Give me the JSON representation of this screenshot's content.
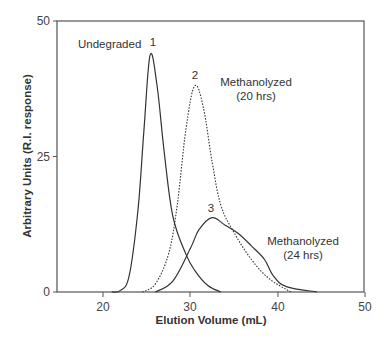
{
  "chart_data": {
    "type": "line",
    "title": "",
    "xlabel": "Elution Volume (mL)",
    "ylabel": "Arbitrary Units (R.I. response)",
    "xlim": [
      15,
      50
    ],
    "ylim": [
      0,
      50
    ],
    "xticks": [
      "20",
      "30",
      "40",
      "50"
    ],
    "yticks": [
      "0",
      "25",
      "50"
    ],
    "grid": false,
    "series": [
      {
        "name": "Undegraded",
        "peak_label": "1",
        "style": "solid",
        "x": [
          21,
          22,
          23,
          24,
          24.7,
          25.4,
          26.2,
          27,
          28,
          29.5,
          30.5,
          32,
          33.5
        ],
        "y": [
          0,
          0.3,
          3,
          15,
          30,
          43.7,
          38,
          26,
          14,
          7,
          4,
          1.2,
          0
        ]
      },
      {
        "name": "Methanolyzed (20 hrs)",
        "peak_label": "2",
        "style": "dotted",
        "x": [
          24.5,
          26,
          27.5,
          28.5,
          29.5,
          30.5,
          31.5,
          32.5,
          33.5,
          35,
          37,
          39,
          41.5
        ],
        "y": [
          0,
          1.5,
          7,
          16,
          30,
          38,
          34,
          24,
          16,
          11,
          6,
          2.5,
          0
        ]
      },
      {
        "name": "Methanolyzed (24 hrs)",
        "peak_label": "3",
        "style": "solid",
        "x": [
          26,
          28,
          30,
          31,
          32.5,
          34,
          35.5,
          37,
          38.5,
          39.5,
          41,
          44.5
        ],
        "y": [
          0,
          2,
          8,
          11.5,
          13.7,
          12.3,
          10.8,
          8.5,
          6,
          3,
          1,
          0
        ]
      }
    ],
    "annotations": [
      {
        "text": "Undegraded",
        "x": 17.5,
        "y": 42
      },
      {
        "text": "1",
        "peak": 1
      },
      {
        "text": "2",
        "peak": 2
      },
      {
        "text": "Methanolyzed",
        "sub": "(20 hrs)"
      },
      {
        "text": "3",
        "peak": 3
      },
      {
        "text": "Methanolyzed",
        "sub": "(24 hrs)"
      }
    ]
  },
  "labels": {
    "undegraded": "Undegraded",
    "peak1": "1",
    "peak2": "2",
    "peak3": "3",
    "meth20_line1": "Methanolyzed",
    "meth20_line2": "(20 hrs)",
    "meth24_line1": "Methanolyzed",
    "meth24_line2": "(24 hrs)",
    "xtitle": "Elution Volume (mL)",
    "ytitle": "Arbitrary Units (R.I. response)",
    "xtick_20": "20",
    "xtick_30": "30",
    "xtick_40": "40",
    "xtick_50": "50",
    "ytick_0": "0",
    "ytick_25": "25",
    "ytick_50": "50"
  }
}
